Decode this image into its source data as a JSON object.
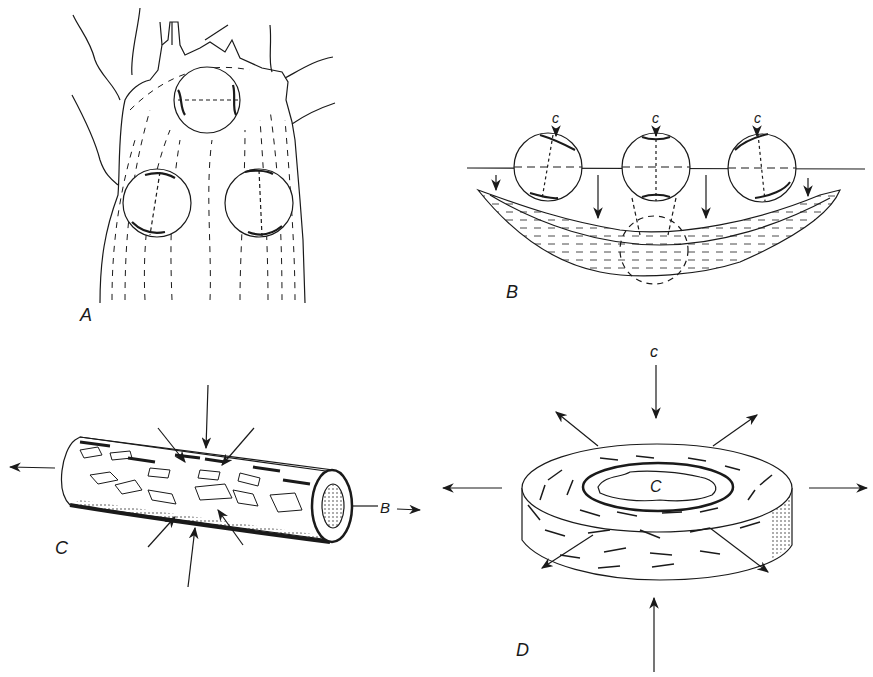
{
  "figure": {
    "panels": [
      {
        "id": "A",
        "label": "A",
        "description": "Elongate body with three circular structures (two lower, one upper) inside a dashed-foliated matrix with branching fractures at the top"
      },
      {
        "id": "B",
        "label": "B",
        "description": "Three circles with poles labelled c above a horizontal dashed line; arrows pointing down onto a lens-shaped foliated body with a dashed circle projection"
      },
      {
        "id": "C",
        "label": "C",
        "description": "Cylinder (prolate shape) with elongate grains, compressed radially by inward arrows and extended along axis, end labelled B"
      },
      {
        "id": "D",
        "label": "D",
        "description": "Flattened disc (oblate shape) with grains aligned tangentially, compressed along vertical axis c and extended radially"
      }
    ],
    "annotations": {
      "b_circle_labels": [
        "c",
        "c",
        "c"
      ],
      "c_axis_label": "B",
      "d_axis_label": "c",
      "d_center_label": "C"
    },
    "colors": {
      "ink": "#1a1a1a",
      "paper": "#ffffff"
    }
  }
}
